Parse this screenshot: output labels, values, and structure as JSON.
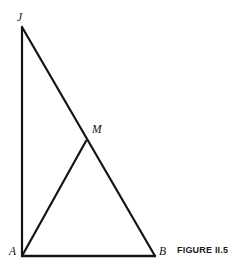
{
  "figure": {
    "caption": "FIGURE II.5",
    "background_color": "#ffffff",
    "stroke_color": "#141414",
    "label_color": "#111111"
  },
  "labels": {
    "apex": "J",
    "midpoint": "M",
    "bottom_left": "A",
    "bottom_right": "B"
  },
  "chart_data": {
    "type": "diagram",
    "title": "FIGURE II.5",
    "points": [
      {
        "name": "J",
        "x": 22,
        "y": 27
      },
      {
        "name": "A",
        "x": 22,
        "y": 256
      },
      {
        "name": "B",
        "x": 155,
        "y": 256
      },
      {
        "name": "M",
        "x": 86,
        "y": 141
      }
    ],
    "segments": [
      {
        "name": "JA",
        "from": "J",
        "to": "A",
        "stroke_width": 2.2
      },
      {
        "name": "AB",
        "from": "A",
        "to": "B",
        "stroke_width": 2.4
      },
      {
        "name": "JB",
        "from": "J",
        "to": "B",
        "stroke_width": 2.2
      },
      {
        "name": "AM",
        "from": "A",
        "to": "M",
        "stroke_width": 2.2
      }
    ],
    "label_positions": [
      {
        "text": "J",
        "x": 20,
        "y": 18
      },
      {
        "text": "M",
        "x": 95,
        "y": 130
      },
      {
        "text": "A",
        "x": 12,
        "y": 252
      },
      {
        "text": "B",
        "x": 162,
        "y": 252
      }
    ],
    "xlim": [
      0,
      245
    ],
    "ylim": [
      0,
      276
    ],
    "grid": false,
    "legend": null
  }
}
